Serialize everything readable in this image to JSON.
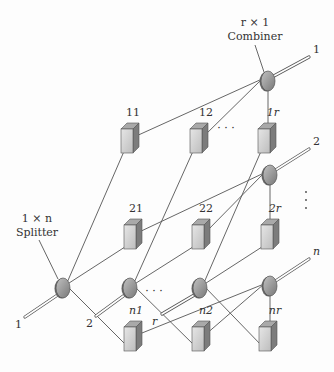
{
  "diagram": {
    "type": "optical-switch-network",
    "combiner_label": {
      "dim": "r × 1",
      "name": "Combiner"
    },
    "splitter_label": {
      "dim": "1 × n",
      "name": "Splitter"
    },
    "inputs": [
      {
        "label": "1",
        "x": 25,
        "y": 322,
        "sx": 63,
        "sy": 288
      },
      {
        "label": "2",
        "x": 96,
        "y": 321,
        "sx": 130,
        "sy": 288
      },
      {
        "label": "r",
        "x": 162,
        "y": 319,
        "sx": 200,
        "sy": 288
      }
    ],
    "outputs": [
      {
        "label": "1",
        "x": 311,
        "y": 53,
        "cx": 268,
        "cy": 81
      },
      {
        "label": "2",
        "x": 311,
        "y": 145,
        "cx": 270,
        "cy": 175
      },
      {
        "label": "n",
        "x": 311,
        "y": 255,
        "cx": 270,
        "cy": 286
      }
    ],
    "boxes": [
      {
        "id": "11",
        "x": 127,
        "y": 141,
        "lx": 133,
        "ly": 116
      },
      {
        "id": "12",
        "x": 196,
        "y": 141,
        "lx": 206,
        "ly": 116
      },
      {
        "id": "1r",
        "x": 264,
        "y": 141,
        "lx": 273,
        "ly": 116
      },
      {
        "id": "21",
        "x": 130,
        "y": 237,
        "lx": 136,
        "ly": 212
      },
      {
        "id": "22",
        "x": 198,
        "y": 237,
        "lx": 206,
        "ly": 212
      },
      {
        "id": "2r",
        "x": 267,
        "y": 237,
        "lx": 275,
        "ly": 212
      },
      {
        "id": "n1",
        "x": 130,
        "y": 339,
        "lx": 136,
        "ly": 314
      },
      {
        "id": "n2",
        "x": 198,
        "y": 339,
        "lx": 206,
        "ly": 314
      },
      {
        "id": "nr",
        "x": 265,
        "y": 339,
        "lx": 275,
        "ly": 314
      }
    ],
    "ellipsis": [
      {
        "text": "· · ·",
        "x": 226,
        "y": 132
      },
      {
        "text": "· · ·",
        "x": 154,
        "y": 295
      }
    ],
    "vertical_dots": {
      "x": 306,
      "y": 192
    },
    "colors": {
      "box_front": "#d4d4d4",
      "box_top": "#a9a9a9",
      "box_side": "#7c7c7c",
      "ellipse_fill": "#9a9a9a",
      "ellipse_edge": "#555555",
      "line": "#555555"
    }
  }
}
